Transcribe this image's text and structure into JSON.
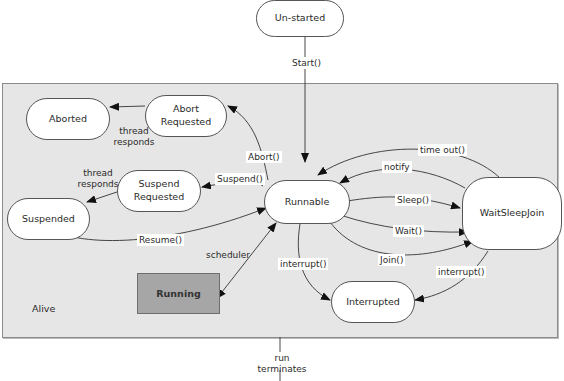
{
  "diagram": {
    "region_label": "Alive",
    "states": {
      "unstarted": "Un-started",
      "runnable": "Runnable",
      "running": "Running",
      "aborted": "Aborted",
      "abort_requested": "Abort Requested",
      "suspend_requested": "Suspend Requested",
      "suspended": "Suspended",
      "waitsleepjoin": "WaitSleepJoin",
      "interrupted": "Interrupted"
    },
    "transitions": {
      "start": "Start()",
      "abort": "Abort()",
      "suspend": "Suspend()",
      "resume": "Resume()",
      "scheduler": "scheduler",
      "thread_responds_abort": "thread responds",
      "thread_responds_suspend": "thread responds",
      "time_out": "time out()",
      "notify": "notify",
      "sleep": "Sleep()",
      "wait": "Wait()",
      "join": "Join()",
      "interrupt_runnable": "interrupt()",
      "interrupt_wsj": "interrupt()",
      "run_terminates": "run terminates"
    }
  }
}
